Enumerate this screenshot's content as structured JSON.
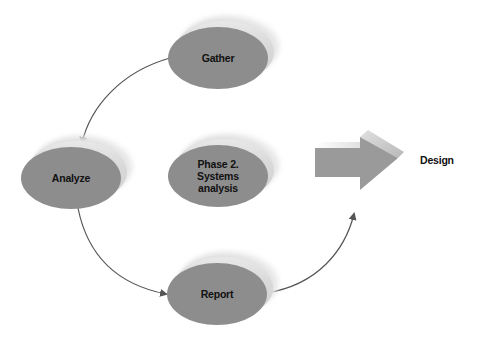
{
  "diagram": {
    "type": "cycle-process",
    "nodes": [
      {
        "id": "gather",
        "label": "Gather"
      },
      {
        "id": "analyze",
        "label": "Analyze"
      },
      {
        "id": "phase",
        "label": "Phase 2.\nSystems\nanalysis"
      },
      {
        "id": "report",
        "label": "Report"
      }
    ],
    "edges": [
      {
        "from": "gather",
        "to": "analyze"
      },
      {
        "from": "analyze",
        "to": "report"
      },
      {
        "from": "report",
        "to": "design-arrow"
      }
    ],
    "next_phase": {
      "label": "Design"
    }
  },
  "colors": {
    "node_fill": "#8d8d8d",
    "node_shadow": "#d0d0d0",
    "arrow": "#555555",
    "block_arrow": "#9a9a9a",
    "text": "#111111"
  }
}
